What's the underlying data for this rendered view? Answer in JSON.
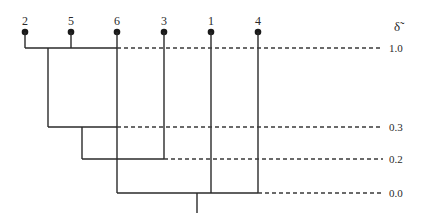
{
  "diagram": {
    "type": "dendrogram",
    "axis_symbol": "δ̃",
    "leaves": [
      {
        "label": "2",
        "x": 25
      },
      {
        "label": "5",
        "x": 71
      },
      {
        "label": "6",
        "x": 117
      },
      {
        "label": "3",
        "x": 164
      },
      {
        "label": "1",
        "x": 211
      },
      {
        "label": "4",
        "x": 258
      }
    ],
    "levels": [
      {
        "label": "1.0",
        "y": 48
      },
      {
        "label": "0.3",
        "y": 127
      },
      {
        "label": "0.2",
        "y": 159
      },
      {
        "label": "0.0",
        "y": 193
      }
    ],
    "merges": [
      {
        "members": [
          "2",
          "5"
        ],
        "level": "1.0"
      },
      {
        "members": [
          "2,5",
          "6"
        ],
        "level": "0.3"
      },
      {
        "members": [
          "2,5,6",
          "3"
        ],
        "level": "0.2"
      },
      {
        "members": [
          "2,5,6,3",
          "1",
          "4"
        ],
        "level": "0.0"
      }
    ]
  }
}
